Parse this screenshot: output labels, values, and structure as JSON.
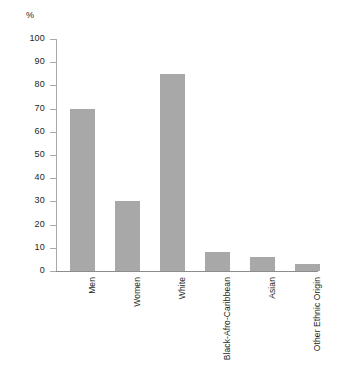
{
  "chart_data": {
    "type": "bar",
    "title": "",
    "subtitle": "",
    "xlabel": "",
    "ylabel": "%",
    "unit_label": "%",
    "categories": [
      "Men",
      "Women",
      "White",
      "Black-Afro-Caribbean",
      "Asian",
      "Other Ethnic Origin"
    ],
    "values": [
      70,
      30,
      85,
      8,
      6,
      3
    ],
    "ylim": [
      0,
      100
    ],
    "ytick_labels": [
      "100",
      "90",
      "80",
      "70",
      "60",
      "50",
      "40",
      "30",
      "20",
      "10",
      "0"
    ],
    "ytick_values": [
      100,
      90,
      80,
      70,
      60,
      50,
      40,
      30,
      20,
      10,
      0
    ],
    "grid": false,
    "legend": null,
    "legend_position": "none",
    "annotations": [],
    "series": [
      {
        "name": "Percentage",
        "values": [
          70,
          30,
          85,
          8,
          6,
          3
        ]
      }
    ],
    "colors": {
      "bar_fill": "#a8a8a8",
      "axis": "#8c8c8c",
      "tick": "#a9a9a9",
      "text": "#231f20",
      "background": "#ffffff"
    }
  }
}
